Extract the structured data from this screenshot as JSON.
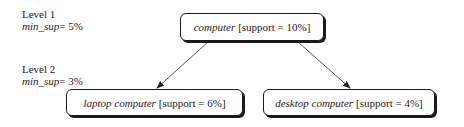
{
  "levels": [
    {
      "label": "Level 1",
      "min_sup_var": "min_sup",
      "min_sup_value": "= 5%"
    },
    {
      "label": "Level 2",
      "min_sup_var": "min_sup",
      "min_sup_value": "= 3%"
    }
  ],
  "nodes": {
    "root": {
      "item": "computer",
      "support": "[support = 10%]"
    },
    "left": {
      "item": "laptop computer",
      "support": "[support = 6%]"
    },
    "right": {
      "item": "desktop computer",
      "support": "[support = 4%]"
    }
  },
  "edges": [
    {
      "from": "root",
      "to": "left"
    },
    {
      "from": "root",
      "to": "right"
    }
  ]
}
